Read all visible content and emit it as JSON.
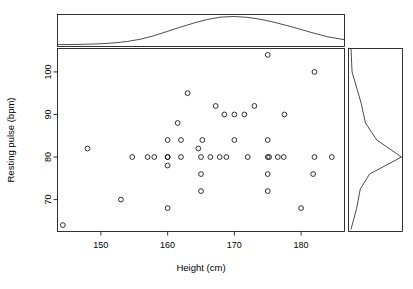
{
  "chart_data": {
    "type": "scatter",
    "title": "",
    "subtitle": "",
    "xlabel": "Height (cm)",
    "ylabel": "Resting pulse (bpm)",
    "xlim": [
      143.5,
      186.5
    ],
    "ylim": [
      62.5,
      105.5
    ],
    "xticks": [
      150,
      160,
      170,
      180
    ],
    "yticks": [
      70,
      80,
      90,
      100
    ],
    "xtick_labels": [
      "150",
      "160",
      "170",
      "180"
    ],
    "ytick_labels": [
      "70",
      "80",
      "90",
      "100"
    ],
    "grid": false,
    "legend": null,
    "marker": "open-circle",
    "x": [
      144.3,
      148.0,
      153.0,
      154.7,
      157.0,
      158.0,
      160.0,
      160.0,
      160.0,
      160.0,
      160.0,
      161.5,
      162.0,
      162.0,
      163.0,
      164.6,
      165.0,
      165.0,
      165.0,
      165.2,
      166.4,
      167.2,
      167.8,
      168.5,
      168.8,
      170.0,
      170.0,
      171.5,
      172.0,
      173.0,
      175.0,
      175.0,
      175.0,
      175.0,
      175.0,
      175.2,
      176.5,
      177.4,
      177.5,
      180.0,
      181.8,
      182.0,
      182.0,
      184.6
    ],
    "y": [
      64.0,
      82.0,
      70.0,
      80.0,
      80.0,
      80.0,
      68.0,
      78.0,
      80.0,
      84.0,
      80.0,
      88.0,
      80.0,
      84.0,
      95.0,
      82.0,
      72.0,
      76.0,
      80.0,
      84.0,
      80.0,
      92.0,
      80.0,
      90.0,
      80.0,
      84.0,
      90.0,
      90.0,
      80.0,
      92.0,
      72.0,
      76.0,
      80.0,
      84.0,
      104.0,
      80.0,
      80.0,
      80.0,
      90.0,
      68.0,
      76.0,
      80.0,
      100.0,
      80.0
    ],
    "n_points": 44,
    "marginal_top": {
      "label": "height-density",
      "type": "density",
      "orientation": "horizontal",
      "x": [
        143.5,
        146,
        148,
        150,
        152,
        154,
        156,
        158,
        160,
        162,
        164,
        166,
        168,
        170,
        172,
        174,
        176,
        178,
        180,
        182,
        184,
        186.5
      ],
      "density": [
        0.03,
        0.035,
        0.045,
        0.06,
        0.09,
        0.14,
        0.22,
        0.34,
        0.49,
        0.64,
        0.78,
        0.9,
        0.98,
        1.0,
        0.97,
        0.9,
        0.8,
        0.68,
        0.55,
        0.42,
        0.3,
        0.2
      ]
    },
    "marginal_right": {
      "label": "pulse-density",
      "type": "density",
      "orientation": "vertical",
      "y": [
        105.5,
        100.0,
        92.5,
        88.0,
        84.0,
        80.0,
        76.0,
        72.5,
        68.0,
        63.0
      ],
      "density": [
        0.02,
        0.04,
        0.22,
        0.3,
        0.52,
        1.0,
        0.38,
        0.2,
        0.13,
        0.02
      ]
    }
  },
  "axes": {
    "x_title": "Height (cm)",
    "y_title": "Resting pulse (bpm)"
  },
  "colors": {
    "foreground": "#000000",
    "background": "#ffffff",
    "marker_stroke": "#000000"
  }
}
